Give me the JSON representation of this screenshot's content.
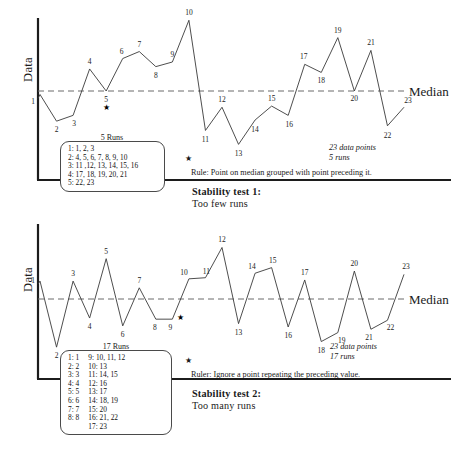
{
  "figure": {
    "title_hidden": "",
    "axis_label": "Data",
    "median_label": "Median",
    "star_glyph": "★"
  },
  "chart_data": [
    {
      "type": "line",
      "id": "stability-test-1",
      "title": "Stability test 1: Too few runs",
      "xlabel": "",
      "ylabel": "Data",
      "grid": false,
      "legend_position": "inset-left",
      "median": 0,
      "ylim": [
        -5.2,
        6.6
      ],
      "xlim": [
        0.3,
        23.7
      ],
      "x": [
        1,
        2,
        3,
        4,
        5,
        6,
        7,
        8,
        9,
        10,
        11,
        12,
        13,
        14,
        15,
        16,
        17,
        18,
        19,
        20,
        21,
        22,
        23
      ],
      "values": [
        -0.3,
        -2.6,
        -2.1,
        1.9,
        0.0,
        2.8,
        3.4,
        2.1,
        2.5,
        6.1,
        -3.4,
        -1.4,
        -4.6,
        -2.5,
        -1.3,
        -2.1,
        2.3,
        1.6,
        4.6,
        0.0,
        3.5,
        -3.0,
        -1.4
      ],
      "on_median_points": [
        5,
        20
      ],
      "star_points": [
        5
      ],
      "runs_title": "5 Runs",
      "runs": [
        "1: 1, 2, 3",
        "2: 4, 5, 6, 7, 8, 9, 10",
        "3: 11 ,12, 13, 14, 15, 16",
        "4: 17, 18, 19, 20, 21",
        "5: 22, 23"
      ],
      "runs_columns": [
        [
          "1: 1, 2, 3",
          "2: 4, 5, 6, 7, 8, 9, 10",
          "3: 11 ,12, 13, 14, 15, 16",
          "4: 17, 18, 19, 20, 21",
          "5: 22, 23"
        ]
      ],
      "summary": [
        "23 data points",
        "5 runs"
      ],
      "rule": "Rule: Point on median grouped with point preceding it.",
      "caption_title": "Stability test 1:",
      "caption_sub": "Too few runs"
    },
    {
      "type": "line",
      "id": "stability-test-2",
      "title": "Stability test 2: Too many runs",
      "xlabel": "",
      "ylabel": "Data",
      "grid": false,
      "legend_position": "inset-left",
      "median": 0,
      "ylim": [
        -5.2,
        6.6
      ],
      "xlim": [
        0.3,
        23.7
      ],
      "x": [
        1,
        2,
        3,
        4,
        5,
        6,
        7,
        8,
        9,
        10,
        11,
        12,
        13,
        14,
        15,
        16,
        17,
        18,
        19,
        20,
        21,
        22,
        23
      ],
      "values": [
        1.6,
        -4.3,
        1.6,
        -1.7,
        3.6,
        -2.4,
        1.0,
        -1.8,
        -1.8,
        1.8,
        1.9,
        4.6,
        -2.2,
        2.3,
        2.8,
        -2.5,
        1.7,
        -3.8,
        -3.0,
        2.5,
        -2.7,
        -1.9,
        2.2
      ],
      "repeated_points": [
        9
      ],
      "star_points": [
        9
      ],
      "runs_title": "17 Runs",
      "runs_columns": [
        [
          "1: 1",
          "2: 2",
          "3: 3",
          "4: 4",
          "5: 5",
          "6: 6",
          "7: 7",
          "8: 8"
        ],
        [
          "9: 10, 11, 12",
          "10: 13",
          "11: 14, 15",
          "12: 16",
          "13: 17",
          "14: 18, 19",
          "15: 20",
          "16: 21, 22",
          "17: 23"
        ]
      ],
      "summary": [
        "23 data points",
        "17 runs"
      ],
      "rule": "Ruler: Ignore a point repeating the preceding value.",
      "caption_title": "Stability test 2:",
      "caption_sub": "Too many runs"
    }
  ]
}
